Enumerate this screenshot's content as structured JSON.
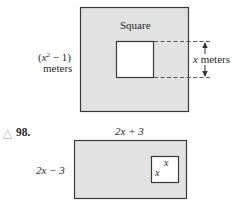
{
  "figure1": {
    "outer_label": "Square",
    "side_label_line1_prefix": "(",
    "side_label_var": "x",
    "side_label_exp": "2",
    "side_label_line1_suffix": " − 1)",
    "side_label_line2": "meters",
    "inner_label_var": "x",
    "inner_label_unit": " meters",
    "colors": {
      "fill": "#e2e2e2",
      "stroke": "#3a3a3a",
      "inner_fill": "#ffffff"
    }
  },
  "figure2": {
    "problem_icon": "triangle-icon",
    "problem_icon_glyph": "△",
    "problem_number": "98.",
    "top_label": "2x + 3",
    "left_label": "2x − 3",
    "inner_top_label": "x",
    "inner_left_label": "x",
    "colors": {
      "fill": "#e2e2e2",
      "stroke": "#3a3a3a",
      "inner_fill": "#ffffff"
    }
  }
}
